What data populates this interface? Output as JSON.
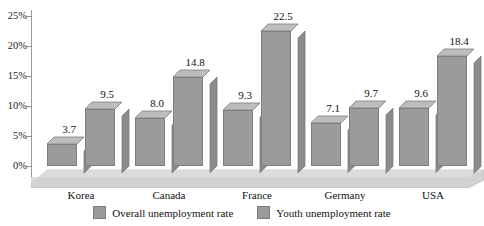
{
  "chart_data": {
    "type": "bar",
    "title": "",
    "xlabel": "",
    "ylabel": "",
    "ylim": [
      0,
      25
    ],
    "ytick_labels": [
      "0%",
      "5%",
      "10%",
      "15%",
      "20%",
      "25%"
    ],
    "ytick_values": [
      0,
      5,
      10,
      15,
      20,
      25
    ],
    "grid": false,
    "legend_position": "bottom",
    "style": "3d-grouped-column",
    "categories": [
      "Korea",
      "Canada",
      "France",
      "Germany",
      "USA"
    ],
    "series": [
      {
        "name": "Overall unemployment rate",
        "color": "#9b9b9b",
        "values": [
          3.7,
          8.0,
          9.3,
          7.1,
          9.6
        ],
        "labels": [
          "3.7",
          "8.0",
          "9.3",
          "7.1",
          "9.6"
        ]
      },
      {
        "name": "Youth unemployment rate",
        "color": "#9b9b9b",
        "values": [
          9.5,
          14.8,
          22.5,
          9.7,
          18.4
        ],
        "labels": [
          "9.5",
          "14.8",
          "22.5",
          "9.7",
          "18.4"
        ]
      }
    ]
  },
  "colors": {
    "bar_front": "#9b9b9b",
    "bar_top": "#bdbdbd",
    "bar_side": "#8b8b8b",
    "bar_outline": "#7e7e7e",
    "floor_top": "#d4d4d4",
    "floor_front": "#c0c0c0",
    "axis": "#9a9a9a",
    "text": "#111111"
  },
  "legend": {
    "items": [
      {
        "label": "Overall unemployment rate"
      },
      {
        "label": "Youth unemployment rate"
      }
    ]
  }
}
